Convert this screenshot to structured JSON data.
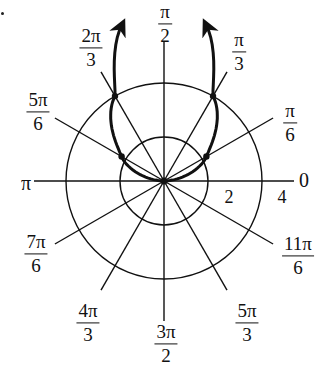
{
  "figure": {
    "type": "polar-graph",
    "center_px": [
      164,
      181
    ],
    "grid": {
      "circles": [
        {
          "r": 2,
          "label": "2",
          "radius_px": 44
        },
        {
          "r": 4,
          "label": "4",
          "radius_px": 98
        }
      ],
      "rays_deg": [
        0,
        30,
        60,
        90,
        120,
        150,
        180,
        210,
        240,
        270,
        300,
        330
      ]
    },
    "angle_labels": [
      {
        "id": "0",
        "text": "0"
      },
      {
        "id": "pi6",
        "num": "π",
        "den": "6"
      },
      {
        "id": "pi3",
        "num": "π",
        "den": "3"
      },
      {
        "id": "pi2",
        "num": "π",
        "den": "2"
      },
      {
        "id": "2pi3",
        "num": "2π",
        "den": "3"
      },
      {
        "id": "5pi6",
        "num": "5π",
        "den": "6"
      },
      {
        "id": "pi",
        "text": "π"
      },
      {
        "id": "7pi6",
        "num": "7π",
        "den": "6"
      },
      {
        "id": "4pi3",
        "num": "4π",
        "den": "3"
      },
      {
        "id": "3pi2",
        "num": "3π",
        "den": "2"
      },
      {
        "id": "5pi3",
        "num": "5π",
        "den": "3"
      },
      {
        "id": "11pi6",
        "num": "11π",
        "den": "6"
      }
    ],
    "radial_labels": [
      {
        "id": "r2",
        "text": "2"
      },
      {
        "id": "r4",
        "text": "4"
      }
    ],
    "curve": {
      "description": "Heavy symmetric polar curve through the pole, opening upward with arrowheads at both ends",
      "color": "#111111",
      "marked_points": [
        {
          "theta": "π/6",
          "r": 2
        },
        {
          "theta": "π/3",
          "r": 4
        },
        {
          "theta": "2π/3",
          "r": 4
        },
        {
          "theta": "5π/6",
          "r": 2
        }
      ],
      "arrows": [
        "upper-left end",
        "upper-right end"
      ]
    }
  },
  "chart_data": {
    "type": "polar",
    "title": "",
    "r_ticks": [
      2,
      4
    ],
    "theta_ticks": [
      "0",
      "π/6",
      "π/3",
      "π/2",
      "2π/3",
      "5π/6",
      "π",
      "7π/6",
      "4π/3",
      "3π/2",
      "5π/3",
      "11π/6"
    ],
    "series": [
      {
        "name": "curve",
        "points": [
          {
            "theta_deg": 0,
            "r": 0
          },
          {
            "theta_deg": 30,
            "r": 2
          },
          {
            "theta_deg": 60,
            "r": 4
          },
          {
            "theta_deg": 75,
            "r": 6.6
          },
          {
            "theta_deg": 105,
            "r": 6.6
          },
          {
            "theta_deg": 120,
            "r": 4
          },
          {
            "theta_deg": 150,
            "r": 2
          },
          {
            "theta_deg": 180,
            "r": 0
          }
        ],
        "highlighted": [
          {
            "theta_deg": 30,
            "r": 2
          },
          {
            "theta_deg": 60,
            "r": 4
          },
          {
            "theta_deg": 120,
            "r": 4
          },
          {
            "theta_deg": 150,
            "r": 2
          }
        ]
      }
    ],
    "grid": true,
    "legend": null
  }
}
